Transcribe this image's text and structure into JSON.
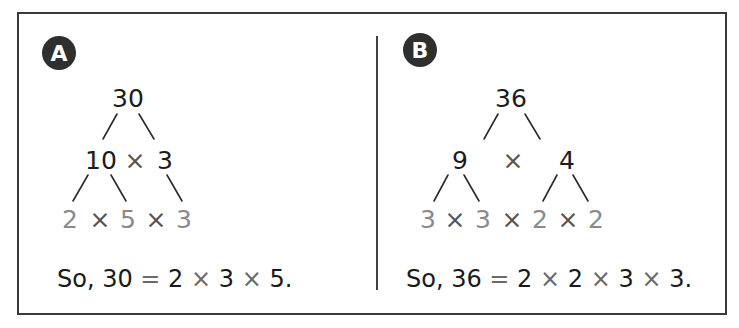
{
  "panels": [
    {
      "label": "A",
      "root": "30",
      "level1": [
        "10",
        "×",
        "3"
      ],
      "level2": [
        "2",
        "×",
        "5",
        "×",
        "3"
      ],
      "conclusion": {
        "prefix": "So, 30",
        "equals": "=",
        "factors": [
          "2",
          "×",
          "3",
          "×",
          "5."
        ]
      }
    },
    {
      "label": "B",
      "root": "36",
      "level1": [
        "9",
        "×",
        "4"
      ],
      "level2": [
        "3",
        "×",
        "3",
        "×",
        "2",
        "×",
        "2"
      ],
      "conclusion": {
        "prefix": "So, 36",
        "equals": "=",
        "factors": [
          "2",
          "×",
          "2",
          "×",
          "3",
          "×",
          "3."
        ]
      }
    }
  ],
  "colors": {
    "border": "#3a3a3a",
    "badge": "#2f2f2f",
    "prime_factor_text": "#8a8a8a",
    "main_text": "#1c1c1c"
  }
}
